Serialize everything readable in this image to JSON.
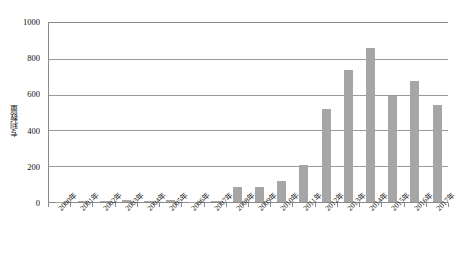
{
  "chart_data": {
    "type": "bar",
    "title": "",
    "subtitle": "",
    "xlabel": "",
    "ylabel": "专利数量",
    "ylim": [
      0,
      1000
    ],
    "ytick_values": [
      0,
      200,
      400,
      600,
      800,
      1000
    ],
    "ytick_labels": [
      "0",
      "200",
      "400",
      "600",
      "800",
      "1000"
    ],
    "grid": true,
    "legend": false,
    "legend_position": "none",
    "bar_color": "#a6a6a6",
    "categories": [
      "2000年",
      "2001年",
      "2002年",
      "2003年",
      "2004年",
      "2005年",
      "2006年",
      "2007年",
      "2008年",
      "2009年",
      "2010年",
      "2011年",
      "2012年",
      "2013年",
      "2014年",
      "2015年",
      "2016年",
      "2017年"
    ],
    "values": [
      2,
      3,
      5,
      13,
      4,
      14,
      2,
      7,
      84,
      86,
      120,
      206,
      519,
      735,
      860,
      595,
      678,
      543
    ]
  },
  "axis": {
    "y_title": "专利数量"
  }
}
